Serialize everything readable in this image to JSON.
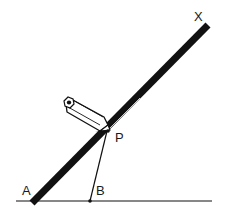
{
  "diagram": {
    "labels": {
      "x": "X",
      "p": "P",
      "a": "A",
      "b": "B"
    },
    "elements": {
      "ruler": "straightedge from A to X",
      "baseline": "horizontal ground line through A and B",
      "pencil": "pencil with tip at P touching the straightedge",
      "segment": "line from P to B"
    },
    "colors": {
      "ink": "#111111",
      "background": "#ffffff"
    }
  }
}
